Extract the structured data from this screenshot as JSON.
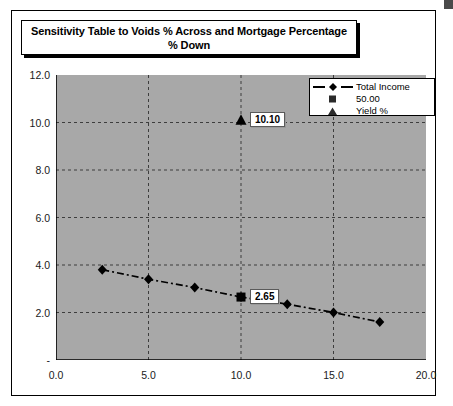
{
  "chart_title": "Sensitivity Table to Voids % Across and Mortgage Percentage % Down",
  "legend": {
    "entries": [
      {
        "label": "Total Income",
        "marker": "diamond-line-icon"
      },
      {
        "label": "50.00",
        "marker": "square-marker-icon"
      },
      {
        "label": "Yield %",
        "marker": "triangle-marker-icon"
      }
    ]
  },
  "chart_data": {
    "type": "line",
    "title": "Sensitivity Table to Voids % Across and Mortgage Percentage % Down",
    "xlabel": "",
    "ylabel": "",
    "xlim": [
      0.0,
      20.0
    ],
    "ylim": [
      0.0,
      12.0
    ],
    "xticks": [
      0.0,
      5.0,
      10.0,
      15.0,
      20.0
    ],
    "xticklabels": [
      "0.0",
      "5.0",
      "10.0",
      "15.0",
      "20.0"
    ],
    "yticks": [
      0.0,
      2.0,
      4.0,
      6.0,
      8.0,
      10.0,
      12.0
    ],
    "yticklabels": [
      "-",
      "2.0",
      "4.0",
      "6.0",
      "8.0",
      "10.0",
      "12.0"
    ],
    "grid": true,
    "grid_style": "dashed",
    "plot_bgcolor": "#a8a8a8",
    "series": [
      {
        "name": "Total Income",
        "marker": "diamond",
        "linestyle": "dashdot",
        "color": "#000000",
        "x": [
          2.5,
          5.0,
          7.5,
          10.0,
          12.5,
          15.0,
          17.5
        ],
        "y": [
          3.8,
          3.4,
          3.05,
          2.65,
          2.35,
          2.0,
          1.6
        ]
      },
      {
        "name": "50.00",
        "marker": "square",
        "linestyle": "none",
        "color": "#000000",
        "x": [
          10.0
        ],
        "y": [
          2.65
        ],
        "data_labels": [
          "2.65"
        ]
      },
      {
        "name": "Yield %",
        "marker": "triangle",
        "linestyle": "none",
        "color": "#000000",
        "x": [
          10.0
        ],
        "y": [
          10.1
        ],
        "data_labels": [
          "10.10"
        ]
      }
    ],
    "annotations": [
      {
        "text": "10.10",
        "x": 10.0,
        "y": 10.1
      },
      {
        "text": "2.65",
        "x": 10.0,
        "y": 2.65
      }
    ]
  }
}
